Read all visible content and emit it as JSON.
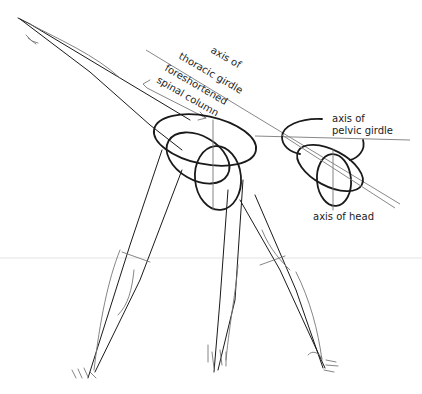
{
  "figure": {
    "labels": {
      "thoracic_axis_line1": "axis of",
      "thoracic_axis_line2": "thoracic girdle",
      "spine_line1": "foreshortened",
      "spine_line2": "spinal column",
      "pelvic_axis_line1": "axis of",
      "pelvic_axis_line2": "pelvic girdle",
      "head_axis": "axis of head"
    },
    "colors": {
      "ink": "#1a1a1a",
      "pencil": "#777777",
      "guide": "#888888",
      "background": "#ffffff"
    }
  }
}
